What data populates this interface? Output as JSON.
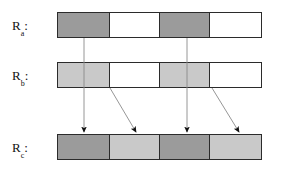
{
  "figure": {
    "background_color": "#ffffff",
    "border_color": "#2b2b2b",
    "width": 281,
    "height": 170
  },
  "palette": {
    "dark_gray": "#9b9b9b",
    "light_gray": "#c9c9c9",
    "white": "#ffffff",
    "line": "#8a8a8a",
    "arrow": "#111111",
    "text": "#111111"
  },
  "rows": [
    {
      "id": "ra",
      "label_base": "R",
      "label_sub": "a",
      "label_colon": ":",
      "label_text": "R",
      "label_full": "Ra:",
      "x": 57,
      "y": 12,
      "width": 208,
      "height": 26,
      "cells": [
        {
          "index": 0,
          "fill": "#9b9b9b",
          "shade": "dark",
          "width": 53
        },
        {
          "index": 1,
          "fill": "#ffffff",
          "shade": "white",
          "width": 51
        },
        {
          "index": 2,
          "fill": "#9b9b9b",
          "shade": "dark",
          "width": 51
        },
        {
          "index": 3,
          "fill": "#ffffff",
          "shade": "white",
          "width": 53
        }
      ]
    },
    {
      "id": "rb",
      "label_base": "R",
      "label_sub": "b",
      "label_colon": ":",
      "label_text": "R",
      "label_full": "Rb:",
      "x": 57,
      "y": 62,
      "width": 208,
      "height": 26,
      "cells": [
        {
          "index": 0,
          "fill": "#c9c9c9",
          "shade": "light",
          "width": 53
        },
        {
          "index": 1,
          "fill": "#ffffff",
          "shade": "white",
          "width": 51
        },
        {
          "index": 2,
          "fill": "#c9c9c9",
          "shade": "light",
          "width": 51
        },
        {
          "index": 3,
          "fill": "#ffffff",
          "shade": "white",
          "width": 53
        }
      ]
    },
    {
      "id": "rc",
      "label_base": "R",
      "label_sub": "c",
      "label_colon": ":",
      "label_text": "R",
      "label_full": "Rc:",
      "x": 57,
      "y": 134,
      "width": 208,
      "height": 26,
      "cells": [
        {
          "index": 0,
          "fill": "#9b9b9b",
          "shade": "dark",
          "width": 53
        },
        {
          "index": 1,
          "fill": "#c9c9c9",
          "shade": "light",
          "width": 51
        },
        {
          "index": 2,
          "fill": "#9b9b9b",
          "shade": "dark",
          "width": 51
        },
        {
          "index": 3,
          "fill": "#c9c9c9",
          "shade": "light",
          "width": 53
        }
      ]
    }
  ],
  "labels": [
    {
      "id": "label-ra",
      "x": 12,
      "y": 25,
      "text": "R",
      "sub": "a",
      "colon": ":"
    },
    {
      "id": "label-rb",
      "x": 12,
      "y": 75,
      "text": "R",
      "sub": "b",
      "colon": ":"
    },
    {
      "id": "label-rc",
      "x": 12,
      "y": 147,
      "text": "R",
      "sub": "c",
      "colon": ":"
    }
  ],
  "connectors": [
    {
      "id": "ra-to-rb-left",
      "kind": "plain-line",
      "x1": 84,
      "y1": 38,
      "x2": 84,
      "y2": 62
    },
    {
      "id": "ra-to-rb-right",
      "kind": "plain-line",
      "x1": 187,
      "y1": 38,
      "x2": 187,
      "y2": 62
    },
    {
      "id": "rb-to-rc-vertical-left",
      "kind": "arrow-vertical",
      "x1": 84,
      "y1": 62,
      "x2": 84,
      "y2": 132
    },
    {
      "id": "rb-to-rc-vertical-right",
      "kind": "arrow-vertical",
      "x1": 187,
      "y1": 62,
      "x2": 187,
      "y2": 132
    },
    {
      "id": "rb-to-rc-diagonal-left",
      "kind": "arrow-diagonal",
      "x1": 110,
      "y1": 88,
      "x2": 136,
      "y2": 132
    },
    {
      "id": "rb-to-rc-diagonal-right",
      "kind": "arrow-diagonal",
      "x1": 212,
      "y1": 88,
      "x2": 239,
      "y2": 132
    }
  ]
}
